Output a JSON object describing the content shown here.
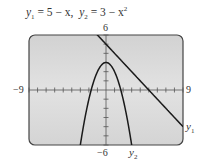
{
  "title": {
    "y1_lhs": "y",
    "y1_sub": "1",
    "y1_rhs": " = 5 − x,",
    "y2_lhs": "y",
    "y2_sub": "2",
    "y2_rhs": " = 3 − x",
    "y2_exp": "2"
  },
  "window": {
    "xmin": -9,
    "xmax": 9,
    "ymin": -6,
    "ymax": 6,
    "xscl": 1,
    "yscl": 1,
    "labels": {
      "ymax": "6",
      "ymin": "−6",
      "xmin": "−9",
      "xmax": "9"
    }
  },
  "curves": [
    {
      "name": "y1",
      "label": "y",
      "sub": "1",
      "expr": "5 - x"
    },
    {
      "name": "y2",
      "label": "y",
      "sub": "2",
      "expr": "3 - x^2"
    }
  ],
  "colors": {
    "screen_bg": "#d9d9d9",
    "screen_border": "#444444",
    "curve": "#1a1a1a",
    "axis": "#555555"
  }
}
